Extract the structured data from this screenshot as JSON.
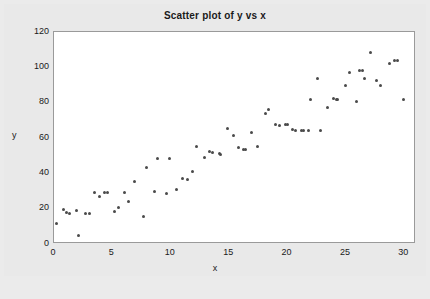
{
  "window": {
    "background_color": "#ebebeb",
    "panel_color": "#ffffff",
    "frame_color": "#9a9a9a"
  },
  "chart_data": {
    "type": "scatter",
    "title": "Scatter plot of y vs x",
    "xlabel": "x",
    "ylabel": "y",
    "xlim": [
      0,
      31
    ],
    "ylim": [
      0,
      120
    ],
    "xticks": [
      0,
      5,
      10,
      15,
      20,
      25,
      30
    ],
    "yticks": [
      0,
      20,
      40,
      60,
      80,
      100,
      120
    ],
    "grid": false,
    "legend": null,
    "marker": {
      "shape": "circle",
      "color": "#4a4a4a",
      "size_px": 3
    },
    "series": [
      {
        "name": "y vs x",
        "color": "#4a4a4a",
        "points": [
          [
            0.2,
            11.5
          ],
          [
            0.8,
            19.5
          ],
          [
            1.1,
            17.6
          ],
          [
            1.3,
            17.5
          ],
          [
            1.9,
            19.2
          ],
          [
            2.1,
            5.0
          ],
          [
            2.7,
            17.0
          ],
          [
            3.0,
            17.2
          ],
          [
            3.5,
            29.3
          ],
          [
            3.9,
            26.8
          ],
          [
            4.3,
            29.2
          ],
          [
            4.6,
            29.2
          ],
          [
            5.2,
            18.6
          ],
          [
            5.5,
            20.8
          ],
          [
            6.0,
            29.1
          ],
          [
            6.4,
            24.1
          ],
          [
            6.9,
            35.3
          ],
          [
            7.7,
            15.7
          ],
          [
            7.9,
            43.2
          ],
          [
            8.6,
            29.6
          ],
          [
            8.9,
            48.2
          ],
          [
            9.6,
            28.8
          ],
          [
            9.9,
            48.4
          ],
          [
            10.5,
            31.1
          ],
          [
            11.0,
            36.9
          ],
          [
            11.4,
            36.4
          ],
          [
            11.9,
            40.8
          ],
          [
            12.2,
            55.3
          ],
          [
            12.9,
            48.9
          ],
          [
            13.3,
            52.1
          ],
          [
            13.6,
            51.6
          ],
          [
            14.2,
            51.0
          ],
          [
            14.3,
            50.6
          ],
          [
            14.9,
            65.1
          ],
          [
            15.4,
            61.6
          ],
          [
            15.8,
            54.6
          ],
          [
            16.2,
            53.6
          ],
          [
            16.4,
            53.5
          ],
          [
            16.9,
            63.3
          ],
          [
            17.4,
            55.4
          ],
          [
            18.1,
            73.6
          ],
          [
            18.4,
            76.2
          ],
          [
            19.0,
            67.4
          ],
          [
            19.3,
            67.1
          ],
          [
            19.8,
            67.8
          ],
          [
            20.0,
            67.5
          ],
          [
            20.4,
            64.6
          ],
          [
            20.7,
            64.5
          ],
          [
            21.2,
            64.3
          ],
          [
            21.4,
            64.2
          ],
          [
            21.8,
            64.3
          ],
          [
            22.0,
            81.8
          ],
          [
            22.6,
            93.8
          ],
          [
            22.8,
            64.4
          ],
          [
            23.4,
            77.0
          ],
          [
            23.9,
            82.3
          ],
          [
            24.2,
            82.0
          ],
          [
            24.3,
            81.9
          ],
          [
            25.0,
            89.6
          ],
          [
            25.3,
            96.8
          ],
          [
            25.9,
            80.6
          ],
          [
            26.2,
            98.3
          ],
          [
            26.4,
            98.4
          ],
          [
            26.6,
            93.6
          ],
          [
            27.1,
            108.3
          ],
          [
            27.6,
            92.3
          ],
          [
            28.0,
            89.7
          ],
          [
            28.7,
            102.2
          ],
          [
            29.2,
            103.6
          ],
          [
            29.4,
            103.8
          ],
          [
            29.9,
            81.6
          ]
        ]
      }
    ]
  }
}
